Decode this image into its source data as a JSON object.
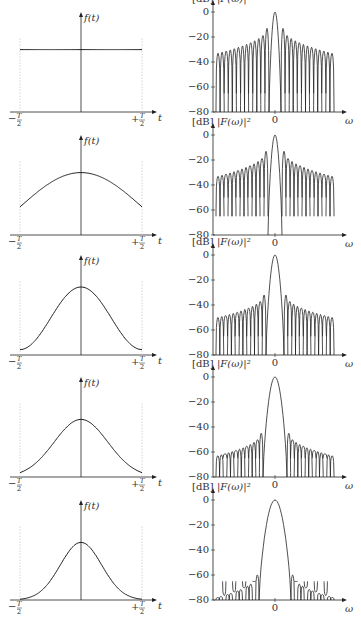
{
  "labels": {
    "time_ylabel": "f(t)",
    "time_xlabel": "t",
    "time_left_tick": "−T/2",
    "time_right_tick": "+T/2",
    "spec_unit": "[dB]",
    "spec_ylabel": "|F(ω)|²",
    "spec_xlabel": "ω",
    "spec_zero": "0",
    "spec_yticks": [
      "0",
      "−20",
      "−40",
      "−60",
      "−80"
    ]
  },
  "chart_data": [
    {
      "type": "line",
      "row": 1,
      "title": "Rectangular window",
      "time_shape": "rect",
      "sidelobe_peak_db": -13,
      "sidelobe_tail_db": -33,
      "null_depth_db": -80,
      "ylim": [
        -80,
        0
      ]
    },
    {
      "type": "line",
      "row": 2,
      "title": "Cosine-taper window (wide)",
      "time_shape": "cos",
      "edge_level": 0.45,
      "sidelobe_peak_db": -13,
      "sidelobe_tail_db": -33,
      "null_depth_db": -65,
      "ylim": [
        -80,
        0
      ]
    },
    {
      "type": "line",
      "row": 3,
      "title": "Raised-cosine-like window",
      "time_shape": "bell",
      "edge_level": 0.08,
      "sidelobe_peak_db": -32,
      "sidelobe_tail_db": -50,
      "null_depth_db": -80,
      "ylim": [
        -80,
        0
      ]
    },
    {
      "type": "line",
      "row": 4,
      "title": "Gaussian-like window",
      "time_shape": "gauss",
      "sigma": 0.22,
      "sidelobe_peak_db": -45,
      "sidelobe_tail_db": -63,
      "null_depth_db": -80,
      "ylim": [
        -80,
        0
      ]
    },
    {
      "type": "line",
      "row": 5,
      "title": "Narrow Gaussian-like window",
      "time_shape": "gauss",
      "sigma": 0.17,
      "sidelobe_peak_db": -60,
      "sidelobe_tail_db": -78,
      "null_depth_db": -80,
      "ylim": [
        -80,
        0
      ]
    }
  ]
}
